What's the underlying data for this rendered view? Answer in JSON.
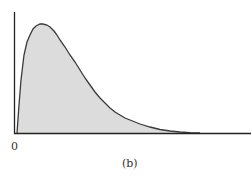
{
  "chart_data": {
    "type": "area",
    "title": "",
    "caption": "(b)",
    "xlabel": "",
    "ylabel": "",
    "x_tick_labels": [
      "0"
    ],
    "grid": false,
    "legend": null,
    "curve_points_px": [
      [
        17,
        133
      ],
      [
        19,
        105
      ],
      [
        21,
        80
      ],
      [
        24,
        55
      ],
      [
        27,
        42
      ],
      [
        30,
        35
      ],
      [
        33,
        29
      ],
      [
        36,
        26
      ],
      [
        40,
        24
      ],
      [
        43,
        24
      ],
      [
        47,
        25
      ],
      [
        50,
        27
      ],
      [
        54,
        31
      ],
      [
        57,
        35
      ],
      [
        60,
        40
      ],
      [
        65,
        47
      ],
      [
        70,
        55
      ],
      [
        75,
        62
      ],
      [
        80,
        70
      ],
      [
        85,
        78
      ],
      [
        90,
        85
      ],
      [
        95,
        92
      ],
      [
        100,
        98
      ],
      [
        105,
        103
      ],
      [
        110,
        108
      ],
      [
        115,
        112
      ],
      [
        120,
        115
      ],
      [
        125,
        118
      ],
      [
        130,
        120
      ],
      [
        140,
        124
      ],
      [
        150,
        127
      ],
      [
        160,
        129.5
      ],
      [
        170,
        131
      ],
      [
        180,
        132
      ],
      [
        190,
        132.7
      ],
      [
        200,
        133
      ]
    ],
    "colors": {
      "fill": "#dcdcdc",
      "stroke": "#3a3a3a",
      "axis": "#222222"
    }
  },
  "labels": {
    "origin": "0",
    "caption": "(b)"
  }
}
